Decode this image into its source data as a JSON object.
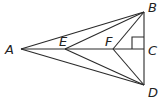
{
  "diagram": {
    "type": "geometry",
    "points": {
      "A": {
        "label": "A",
        "x": 21,
        "y": 49
      },
      "E": {
        "label": "E",
        "x": 65,
        "y": 49
      },
      "F": {
        "label": "F",
        "x": 113,
        "y": 49
      },
      "C": {
        "label": "C",
        "x": 144,
        "y": 49
      },
      "B": {
        "label": "B",
        "x": 144,
        "y": 12
      },
      "D": {
        "label": "D",
        "x": 144,
        "y": 85
      }
    },
    "segments": [
      [
        "A",
        "B"
      ],
      [
        "A",
        "D"
      ],
      [
        "A",
        "C"
      ],
      [
        "E",
        "B"
      ],
      [
        "E",
        "D"
      ],
      [
        "F",
        "B"
      ],
      [
        "F",
        "D"
      ],
      [
        "B",
        "D"
      ]
    ],
    "right_angle_at": "C"
  }
}
